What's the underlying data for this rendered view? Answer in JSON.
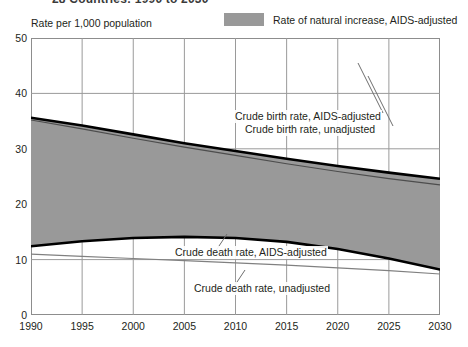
{
  "title": "28 Countries:  1990 to 2030",
  "y_axis_caption": "Rate per 1,000 population",
  "legend": {
    "swatch_color": "#999999",
    "label": "Rate of natural increase, AIDS-adjusted"
  },
  "annotations": {
    "birth_adjusted": "Crude birth rate, AIDS-adjusted",
    "birth_unadjusted": "Crude birth rate, unadjusted",
    "death_adjusted": "Crude death rate, AIDS-adjusted",
    "death_unadjusted": "Crude death rate, unadjusted"
  },
  "chart_data": {
    "type": "area",
    "title": "28 Countries:  1990 to 2030",
    "xlabel": "",
    "ylabel": "Rate per 1,000 population",
    "xlim": [
      1990,
      2030
    ],
    "ylim": [
      0,
      50
    ],
    "xticks": [
      1990,
      1995,
      2000,
      2005,
      2010,
      2015,
      2020,
      2025,
      2030
    ],
    "yticks": [
      0,
      10,
      20,
      30,
      40,
      50
    ],
    "grid": true,
    "legend_position": "top-right",
    "x": [
      1990,
      1995,
      2000,
      2005,
      2010,
      2015,
      2020,
      2025,
      2030
    ],
    "series": [
      {
        "name": "Crude birth rate, AIDS-adjusted",
        "style": "thick-black-line",
        "color": "#000000",
        "values": [
          35.6,
          34.2,
          32.6,
          31.0,
          29.6,
          28.2,
          26.9,
          25.7,
          24.6
        ]
      },
      {
        "name": "Crude birth rate, unadjusted",
        "style": "thin-dark-line",
        "color": "#4d4d4d",
        "values": [
          35.2,
          33.6,
          31.9,
          30.3,
          28.8,
          27.3,
          25.9,
          24.6,
          23.5
        ]
      },
      {
        "name": "Crude death rate, AIDS-adjusted",
        "style": "thick-black-line",
        "color": "#000000",
        "values": [
          12.4,
          13.3,
          13.9,
          14.1,
          13.9,
          13.2,
          11.9,
          10.2,
          8.2
        ]
      },
      {
        "name": "Crude death rate, unadjusted",
        "style": "thin-gray-line",
        "color": "#808080",
        "values": [
          11.0,
          10.6,
          10.2,
          9.8,
          9.4,
          9.0,
          8.5,
          8.0,
          7.4
        ]
      }
    ],
    "shaded_band": {
      "name": "Rate of natural increase, AIDS-adjusted",
      "color": "#999999",
      "upper_series": "Crude birth rate, AIDS-adjusted",
      "lower_series": "Crude death rate, AIDS-adjusted",
      "values": [
        23.2,
        20.9,
        18.7,
        16.9,
        15.7,
        15.0,
        15.0,
        15.5,
        16.4
      ]
    }
  }
}
